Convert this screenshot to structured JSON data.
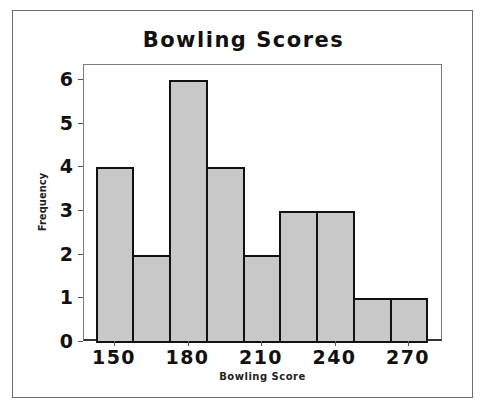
{
  "chart_data": {
    "type": "bar",
    "subtype": "histogram",
    "title": "Bowling Scores",
    "xlabel": "Bowling Score",
    "ylabel": "Frequency",
    "bin_width": 15,
    "bins": [
      {
        "start": 142.5,
        "end": 157.5,
        "center": 150,
        "count": 4
      },
      {
        "start": 157.5,
        "end": 172.5,
        "center": 165,
        "count": 2
      },
      {
        "start": 172.5,
        "end": 187.5,
        "center": 180,
        "count": 6
      },
      {
        "start": 187.5,
        "end": 202.5,
        "center": 195,
        "count": 4
      },
      {
        "start": 202.5,
        "end": 217.5,
        "center": 210,
        "count": 2
      },
      {
        "start": 217.5,
        "end": 232.5,
        "center": 225,
        "count": 3
      },
      {
        "start": 232.5,
        "end": 247.5,
        "center": 240,
        "count": 3
      },
      {
        "start": 247.5,
        "end": 262.5,
        "center": 255,
        "count": 1
      },
      {
        "start": 262.5,
        "end": 277.5,
        "center": 270,
        "count": 1
      }
    ],
    "categories": [
      "150",
      "165",
      "180",
      "195",
      "210",
      "225",
      "240",
      "255",
      "270"
    ],
    "values": [
      4,
      2,
      6,
      4,
      2,
      3,
      3,
      1,
      1
    ],
    "x_ticks": [
      "150",
      "180",
      "210",
      "240",
      "270"
    ],
    "y_ticks": [
      "0",
      "1",
      "2",
      "3",
      "4",
      "5",
      "6"
    ],
    "ylim": [
      0,
      6.3
    ],
    "xlim": [
      135,
      282
    ],
    "grid": false,
    "legend": null,
    "colors": {
      "bar_fill": "#c8c8c8",
      "bar_edge": "#111111"
    }
  }
}
